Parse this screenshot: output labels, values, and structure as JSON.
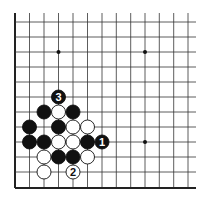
{
  "diagram": {
    "type": "go-board-fragment",
    "grid": {
      "columns": 13,
      "rows": 12,
      "col_x": [
        15,
        29.5,
        44,
        58.5,
        73,
        87.5,
        102,
        116.3,
        130.7,
        145,
        159.3,
        173.7,
        188
      ],
      "row_y": [
        22,
        37,
        52,
        67,
        82,
        97,
        112,
        127,
        142,
        157,
        172,
        188
      ],
      "right_extent": 196,
      "top_extent": 13,
      "edges": [
        "left",
        "bottom"
      ]
    },
    "star_points": [
      {
        "col": 3,
        "row": 2
      },
      {
        "col": 9,
        "row": 2
      },
      {
        "col": 9,
        "row": 8
      }
    ],
    "stones": [
      {
        "color": "black",
        "col": 3,
        "row": 5,
        "label": "3"
      },
      {
        "color": "black",
        "col": 2,
        "row": 6,
        "label": ""
      },
      {
        "color": "white",
        "col": 3,
        "row": 6,
        "label": ""
      },
      {
        "color": "black",
        "col": 4,
        "row": 6,
        "label": ""
      },
      {
        "color": "black",
        "col": 1,
        "row": 7,
        "label": ""
      },
      {
        "color": "black",
        "col": 3,
        "row": 7,
        "label": ""
      },
      {
        "color": "white",
        "col": 4,
        "row": 7,
        "label": ""
      },
      {
        "color": "white",
        "col": 5,
        "row": 7,
        "label": ""
      },
      {
        "color": "black",
        "col": 1,
        "row": 8,
        "label": ""
      },
      {
        "color": "black",
        "col": 2,
        "row": 8,
        "label": ""
      },
      {
        "color": "white",
        "col": 3,
        "row": 8,
        "label": ""
      },
      {
        "color": "white",
        "col": 4,
        "row": 8,
        "label": ""
      },
      {
        "color": "black",
        "col": 5,
        "row": 8,
        "label": ""
      },
      {
        "color": "black",
        "col": 6,
        "row": 8,
        "label": "1"
      },
      {
        "color": "white",
        "col": 2,
        "row": 9,
        "label": ""
      },
      {
        "color": "black",
        "col": 3,
        "row": 9,
        "label": ""
      },
      {
        "color": "black",
        "col": 4,
        "row": 9,
        "label": ""
      },
      {
        "color": "white",
        "col": 5,
        "row": 9,
        "label": ""
      },
      {
        "color": "white",
        "col": 2,
        "row": 10,
        "label": ""
      },
      {
        "color": "white",
        "col": 4,
        "row": 10,
        "label": "2"
      }
    ],
    "colors": {
      "black": "#111111",
      "white": "#ffffff",
      "line": "#333333",
      "edge": "#222222"
    }
  }
}
